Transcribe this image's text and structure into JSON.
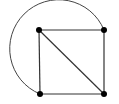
{
  "diagram": {
    "type": "graph",
    "background": "#ffffff",
    "stroke_color": "#333333",
    "vertex_color": "#000000",
    "vertices": [
      {
        "id": "top-left",
        "x": 39,
        "y": 30
      },
      {
        "id": "top-right",
        "x": 104,
        "y": 30
      },
      {
        "id": "bottom-left",
        "x": 40,
        "y": 94
      },
      {
        "id": "bottom-right",
        "x": 104,
        "y": 94
      }
    ],
    "edges": [
      {
        "from": "top-left",
        "to": "top-right",
        "kind": "straight"
      },
      {
        "from": "top-right",
        "to": "bottom-right",
        "kind": "straight"
      },
      {
        "from": "bottom-right",
        "to": "bottom-left",
        "kind": "straight"
      },
      {
        "from": "bottom-left",
        "to": "top-left",
        "kind": "straight"
      },
      {
        "from": "top-left",
        "to": "bottom-right",
        "kind": "straight"
      },
      {
        "from": "top-right",
        "to": "bottom-left",
        "kind": "arc"
      }
    ]
  }
}
